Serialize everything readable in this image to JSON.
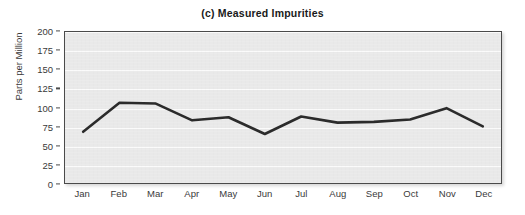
{
  "chart_data": {
    "type": "line",
    "title": "(c) Measured Impurities",
    "xlabel": "",
    "ylabel": "Parts per Million",
    "categories": [
      "Jan",
      "Feb",
      "Mar",
      "Apr",
      "May",
      "Jun",
      "Jul",
      "Aug",
      "Sep",
      "Oct",
      "Nov",
      "Dec"
    ],
    "values": [
      69,
      107,
      106,
      84,
      88,
      66,
      89,
      81,
      82,
      85,
      100,
      76
    ],
    "series": [
      {
        "name": "Measured Impurities",
        "values": [
          69,
          107,
          106,
          84,
          88,
          66,
          89,
          81,
          82,
          85,
          100,
          76
        ]
      }
    ],
    "ylim": [
      0,
      200
    ],
    "yticks": [
      0,
      25,
      50,
      75,
      100,
      125,
      150,
      175,
      200
    ],
    "ytick_labels": [
      "0",
      "25",
      "50",
      "75",
      "100",
      "125",
      "150",
      "175",
      "200"
    ],
    "grid": true,
    "grid_axis": "y",
    "legend": false,
    "legend_position": "none",
    "markers": false,
    "line_color": "#2b2b2b",
    "plot_background": "#e9e9e9",
    "gridline_color": "#fbfbfb",
    "figure_background": "#ffffff",
    "text_color": "#231f20"
  }
}
